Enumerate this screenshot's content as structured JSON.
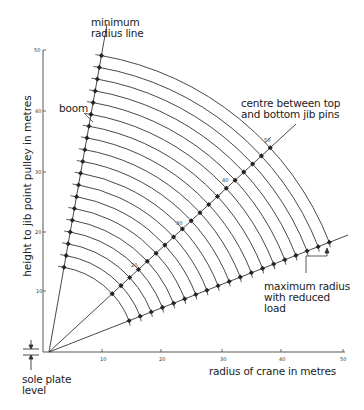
{
  "diagram": {
    "labels": {
      "minimum_radius": [
        "minimum",
        "radius line"
      ],
      "boom": "boom",
      "centre_pins": [
        "centre between top",
        "and bottom jib pins"
      ],
      "max_radius": [
        "maximum radius",
        "with reduced",
        "load"
      ],
      "sole_plate": [
        "sole plate",
        "level"
      ],
      "x_axis": "radius of crane in metres",
      "y_axis": "height to jib point pulley in metres"
    },
    "x_ticks": [
      "10",
      "20",
      "30",
      "40",
      "50"
    ],
    "y_ticks": [
      "10",
      "20",
      "30",
      "40",
      "50"
    ],
    "mid_line_marks": [
      "20",
      "30",
      "40",
      "50"
    ],
    "arc_count": 19,
    "colors": {
      "line": "#333333",
      "background": "#ffffff"
    }
  }
}
